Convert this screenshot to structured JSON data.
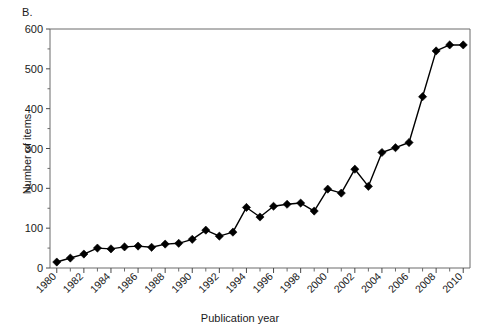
{
  "panel": {
    "label": "B."
  },
  "chart_data": {
    "type": "line",
    "title": "",
    "subtitle": "",
    "xlabel": "Publication year",
    "ylabel": "Number of items",
    "xlim": [
      1979.5,
      2010.5
    ],
    "ylim": [
      0,
      600
    ],
    "grid": false,
    "legend": null,
    "marker": "diamond",
    "line_color": "#000000",
    "marker_color": "#000000",
    "y_major_ticks": [
      0,
      100,
      200,
      300,
      400,
      500,
      600
    ],
    "y_minor_ticks": [
      50,
      150,
      250,
      350,
      450,
      550
    ],
    "y_tick_labels": [
      "0",
      "100",
      "200",
      "300",
      "400",
      "500",
      "600"
    ],
    "x_major_ticks": [
      1980,
      1982,
      1984,
      1986,
      1988,
      1990,
      1992,
      1994,
      1996,
      1998,
      2000,
      2002,
      2004,
      2006,
      2008,
      2010
    ],
    "x_tick_labels": [
      "1980",
      "1982",
      "1984",
      "1986",
      "1988",
      "1990",
      "1992",
      "1994",
      "1996",
      "1998",
      "2000",
      "2002",
      "2004",
      "2006",
      "2008",
      "2010"
    ],
    "x_minor_ticks": [
      1981,
      1983,
      1985,
      1987,
      1989,
      1991,
      1993,
      1995,
      1997,
      1999,
      2001,
      2003,
      2005,
      2007,
      2009
    ],
    "x": [
      1980,
      1981,
      1982,
      1983,
      1984,
      1985,
      1986,
      1987,
      1988,
      1989,
      1990,
      1991,
      1992,
      1993,
      1994,
      1995,
      1996,
      1997,
      1998,
      1999,
      2000,
      2001,
      2002,
      2003,
      2004,
      2005,
      2006,
      2007,
      2008,
      2009,
      2010
    ],
    "values": [
      15,
      25,
      35,
      50,
      48,
      53,
      55,
      52,
      60,
      62,
      72,
      95,
      80,
      90,
      152,
      128,
      155,
      160,
      163,
      143,
      198,
      188,
      248,
      205,
      290,
      302,
      315,
      430,
      545,
      560,
      560
    ]
  }
}
